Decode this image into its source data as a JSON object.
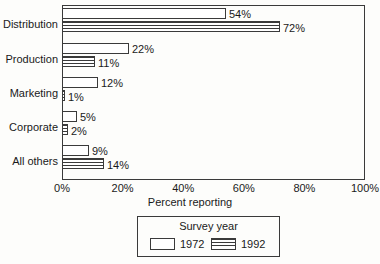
{
  "chart_data": {
    "type": "bar",
    "orientation": "horizontal",
    "title": "",
    "xlabel": "Percent reporting",
    "ylabel": "",
    "xlim": [
      0,
      100
    ],
    "xticks": [
      "0%",
      "20%",
      "40%",
      "60%",
      "80%",
      "100%"
    ],
    "xtick_values": [
      0,
      20,
      40,
      60,
      80,
      100
    ],
    "grid": false,
    "categories": [
      "Distribution",
      "Production",
      "Marketing",
      "Corporate",
      "All others"
    ],
    "series": [
      {
        "name": "1972",
        "values": [
          54,
          22,
          12,
          5,
          9
        ],
        "labels": [
          "54%",
          "22%",
          "12%",
          "5%",
          "9%"
        ],
        "fill": "white"
      },
      {
        "name": "1992",
        "values": [
          72,
          11,
          1,
          2,
          14
        ],
        "labels": [
          "72%",
          "11%",
          "1%",
          "2%",
          "14%"
        ],
        "fill": "horizontal-hatch"
      }
    ],
    "legend": {
      "title": "Survey year",
      "position": "below-center",
      "entries": [
        "1972",
        "1992"
      ]
    },
    "colors": {
      "line": "#3a3a3a",
      "text": "#1a1a1a",
      "background": "#fdfdfb",
      "bar_fill": "#ffffff"
    }
  }
}
